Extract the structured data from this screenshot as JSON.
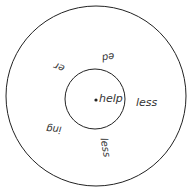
{
  "diagram": {
    "type": "word-wheel",
    "center_word": "help",
    "suffixes": [
      {
        "text": "ed",
        "rotation": 180
      },
      {
        "text": "er",
        "rotation": 200
      },
      {
        "text": "less",
        "rotation": 0
      },
      {
        "text": "ing",
        "rotation": 180
      },
      {
        "text": "less",
        "rotation": 80
      }
    ],
    "colors": {
      "stroke": "#222222",
      "text": "#333333"
    }
  }
}
